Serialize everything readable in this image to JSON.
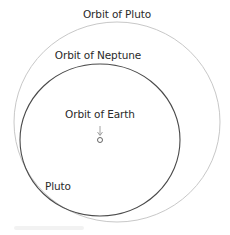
{
  "diagram": {
    "title": "",
    "labels": {
      "pluto_orbit": "Orbit of Pluto",
      "neptune_orbit": "Orbit of Neptune",
      "earth_orbit": "Orbit of Earth",
      "pluto": "Pluto"
    },
    "colors": {
      "background": "#ffffff",
      "pluto_orbit_stroke": "#c8c8c8",
      "neptune_orbit_stroke": "#4a4a4a",
      "earth_stroke": "#555555",
      "arrow_stroke": "#8a8a8a",
      "text": "#2a2a2a"
    },
    "shapes": {
      "pluto_orbit": {
        "cx": 117,
        "cy": 122,
        "rx": 103,
        "ry": 100
      },
      "neptune_orbit": {
        "cx": 100,
        "cy": 140,
        "rx": 80,
        "ry": 76
      },
      "earth_orbit": {
        "cx": 100,
        "cy": 140,
        "r": 2.5
      },
      "earth_arrow": {
        "x": 100,
        "y1": 126,
        "y2": 136
      }
    }
  }
}
